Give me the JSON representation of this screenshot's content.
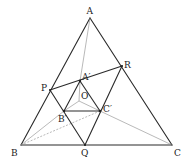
{
  "diagram": {
    "type": "geometry-figure",
    "points": {
      "A": {
        "label": "A",
        "x": 90,
        "y": 18
      },
      "B": {
        "label": "B",
        "x": 21,
        "y": 145
      },
      "C": {
        "label": "C",
        "x": 172,
        "y": 145
      },
      "P": {
        "label": "P",
        "x": 50,
        "y": 90
      },
      "Q": {
        "label": "Q",
        "x": 85,
        "y": 145
      },
      "R": {
        "label": "R",
        "x": 122,
        "y": 66
      },
      "A1": {
        "label": "A′",
        "x": 80,
        "y": 81
      },
      "B1": {
        "label": "B′",
        "x": 64,
        "y": 111
      },
      "C1": {
        "label": "C′",
        "x": 100,
        "y": 111
      },
      "O": {
        "label": "O",
        "x": 79,
        "y": 101
      }
    },
    "labels": {
      "A": "A",
      "B": "B",
      "C": "C",
      "P": "P",
      "Q": "Q",
      "R": "R",
      "A1": "A′",
      "B1": "B′",
      "C1": "C′",
      "O": "O"
    },
    "segments_thick": [
      [
        "A",
        "B"
      ],
      [
        "B",
        "C"
      ],
      [
        "C",
        "A"
      ],
      [
        "P",
        "R"
      ],
      [
        "P",
        "Q"
      ],
      [
        "R",
        "Q"
      ],
      [
        "A1",
        "B1"
      ],
      [
        "B1",
        "C1"
      ],
      [
        "C1",
        "A1"
      ],
      [
        "P",
        "B1"
      ],
      [
        "Q",
        "C1"
      ],
      [
        "R",
        "C1"
      ]
    ],
    "segments_thin": [
      [
        "A",
        "A1"
      ],
      [
        "A1",
        "O"
      ],
      [
        "O",
        "B1"
      ],
      [
        "O",
        "C1"
      ],
      [
        "B",
        "B1"
      ],
      [
        "C1",
        "C"
      ]
    ],
    "segments_dashed": [
      [
        "B",
        "C1"
      ]
    ]
  }
}
